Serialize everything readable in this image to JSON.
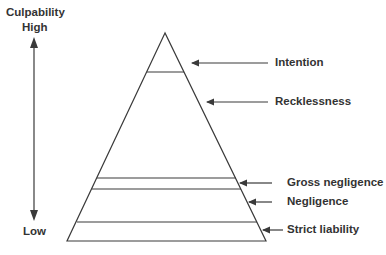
{
  "axis": {
    "title": "Culpability",
    "high_label": "High",
    "low_label": "Low"
  },
  "levels": [
    {
      "label": "Intention"
    },
    {
      "label": "Recklessness"
    },
    {
      "label": "Gross negligence"
    },
    {
      "label": "Negligence"
    },
    {
      "label": "Strict liability"
    }
  ],
  "colors": {
    "line": "#3a3a3a",
    "text": "#333333",
    "background": "#ffffff"
  }
}
